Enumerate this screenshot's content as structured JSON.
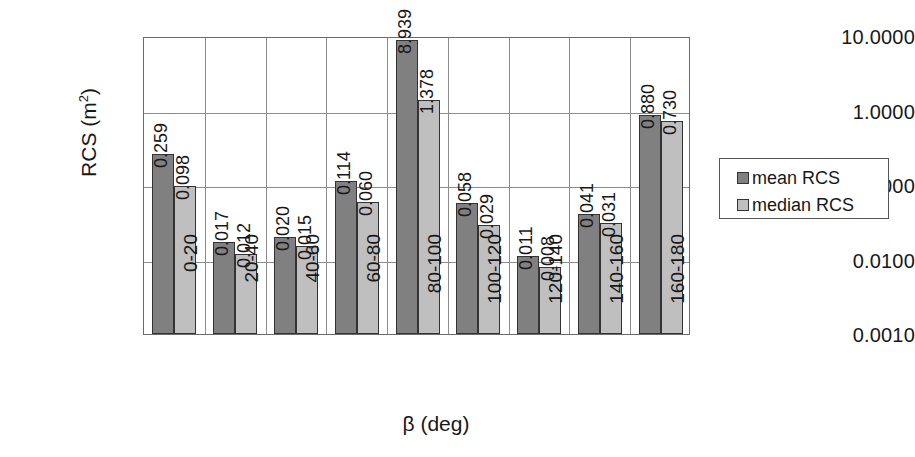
{
  "chart_data": {
    "type": "bar",
    "title": "",
    "xlabel": "β (deg)",
    "ylabel": "RCS (m²)",
    "yscale": "log",
    "ylim": [
      0.001,
      10.0
    ],
    "grid": true,
    "legend_position": "right",
    "categories": [
      "0-20",
      "20-40",
      "40-60",
      "60-80",
      "80-100",
      "100-120",
      "120-140",
      "140-160",
      "160-180"
    ],
    "series": [
      {
        "name": "mean RCS",
        "color": "#808080",
        "values": [
          0.259,
          0.017,
          0.02,
          0.114,
          8.939,
          0.058,
          0.011,
          0.041,
          0.88
        ],
        "labels": [
          "0.259",
          "0.017",
          "0.020",
          "0.114",
          "8.939",
          "0.058",
          "0.011",
          "0.041",
          "0.880"
        ]
      },
      {
        "name": "median RCS",
        "color": "#bfbfbf",
        "values": [
          0.098,
          0.012,
          0.015,
          0.06,
          1.378,
          0.029,
          0.008,
          0.031,
          0.73
        ],
        "labels": [
          "0.098",
          "0.012",
          "0.015",
          "0.060",
          "1.378",
          "0.029",
          "0.008",
          "0.031",
          "0.730"
        ]
      }
    ],
    "yticks": [
      10.0,
      1.0,
      0.1,
      0.01,
      0.001
    ],
    "ytick_labels": [
      "10.0000",
      "1.0000",
      "0.1000",
      "0.0100",
      "0.0010"
    ]
  },
  "axes": {
    "y_title_text": "RCS (m",
    "y_title_sup": "2",
    "y_title_close": ")",
    "x_title": "β (deg)"
  },
  "legend": {
    "entries": [
      {
        "label": "mean RCS",
        "swatch": "mean"
      },
      {
        "label": "median RCS",
        "swatch": "median"
      }
    ]
  }
}
